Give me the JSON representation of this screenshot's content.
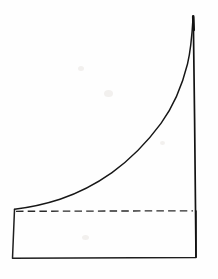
{
  "figure": {
    "title": "Exponentially rising curve over a rectangular base",
    "type": "hand-drawn line diagram",
    "medium": "scanned pen drawing on white paper",
    "background_color": "#fefefe",
    "ink_color": "#1b1b1b",
    "width_px": 218,
    "height_px": 279
  },
  "elements": {
    "rectangle": {
      "name": "base-rectangle",
      "style": "solid",
      "top_left": [
        14,
        209
      ],
      "top_right": [
        196,
        211
      ],
      "bottom_right": [
        196,
        258
      ],
      "bottom_left": [
        12,
        258
      ],
      "path": "M 14.5 209.5 L 12.5 258.2 L 196 257.4 L 196 211"
    },
    "dashed_line": {
      "name": "dashed-baseline",
      "style": "dashed",
      "start": [
        16,
        211
      ],
      "end": [
        193,
        211
      ],
      "dash_length": 7.5,
      "gap_length": 4.2,
      "path": "M 16 211.3 L 193 210.8"
    },
    "curve": {
      "name": "exponential-curve",
      "style": "solid",
      "start": [
        14,
        209
      ],
      "peak": [
        193,
        18
      ],
      "description": "rises slowly from the rectangle's top-left corner then steeply to a sharp peak at top right",
      "path": "M 14.5 209.2 C 28 207.6 44 204.4 60 199.2 C 78 193.2 95 184.6 112 172.6 C 130 159.6 147 142.4 161 123.4 C 173 106.8 182 86.2 187.5 64 C 190.4 52 192 36 193 18.4",
      "sample_points": [
        [
          14,
          209
        ],
        [
          30,
          206
        ],
        [
          45,
          203
        ],
        [
          60,
          199
        ],
        [
          75,
          194
        ],
        [
          90,
          186
        ],
        [
          105,
          177
        ],
        [
          120,
          166
        ],
        [
          135,
          153
        ],
        [
          150,
          137
        ],
        [
          160,
          124
        ],
        [
          170,
          107
        ],
        [
          178,
          88
        ],
        [
          185,
          65
        ],
        [
          190,
          42
        ],
        [
          193,
          18
        ]
      ]
    },
    "vertical_line": {
      "name": "right-vertical-drop",
      "style": "solid",
      "top": [
        193,
        17
      ],
      "bottom": [
        196,
        257
      ],
      "path": "M 193.3 17.2 L 194.6 120 L 196 257"
    },
    "peak_cap": {
      "name": "peak-tip",
      "style": "solid-thick",
      "top": [
        193,
        16
      ],
      "bottom": [
        193.5,
        30
      ],
      "path": "M 193.2 16.4 L 193.7 30"
    }
  },
  "annotations": {
    "axis_labels": [],
    "tick_labels": [],
    "legend": [],
    "text": []
  }
}
